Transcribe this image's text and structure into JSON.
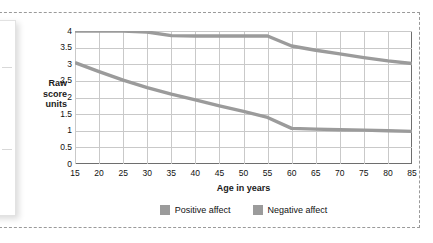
{
  "chart_data": {
    "type": "line",
    "title": "",
    "xlabel": "Age in years",
    "ylabel": "Raw score units",
    "xlim": [
      15,
      85
    ],
    "ylim": [
      0,
      4
    ],
    "grid": true,
    "legend_position": "bottom",
    "x": [
      15,
      20,
      25,
      30,
      35,
      40,
      45,
      50,
      55,
      60,
      65,
      70,
      75,
      80,
      85
    ],
    "xticklabels": [
      "15",
      "20",
      "25",
      "30",
      "35",
      "40",
      "45",
      "50",
      "55",
      "60",
      "65",
      "70",
      "75",
      "80",
      "85"
    ],
    "yticklabels": [
      "0",
      "0.5",
      "1",
      "1.5",
      "2",
      "2.5",
      "3",
      "3.5",
      "4"
    ],
    "yticks": [
      0,
      0.5,
      1,
      1.5,
      2,
      2.5,
      3,
      3.5,
      4
    ],
    "series": [
      {
        "name": "Positive affect",
        "color": "#9b9b9b",
        "values": [
          4.0,
          4.0,
          4.0,
          3.97,
          3.86,
          3.85,
          3.85,
          3.85,
          3.85,
          3.55,
          3.42,
          3.31,
          3.2,
          3.1,
          3.02
        ]
      },
      {
        "name": "Negative affect",
        "color": "#9b9b9b",
        "values": [
          3.05,
          2.78,
          2.52,
          2.3,
          2.1,
          1.93,
          1.75,
          1.58,
          1.4,
          1.07,
          1.05,
          1.03,
          1.02,
          1.0,
          0.98
        ]
      }
    ]
  },
  "axis": {
    "y_title_lines": [
      "Raw",
      "score",
      "units"
    ],
    "x_title": "Age in years"
  },
  "legend": {
    "items": [
      {
        "label": "Positive affect",
        "color": "#9b9b9b"
      },
      {
        "label": "Negative affect",
        "color": "#9b9b9b"
      }
    ]
  },
  "colors": {
    "line": "#9b9b9b",
    "grid": "#c9c9c9",
    "axis": "#6e6e6e",
    "dashed_border": "#9a9a9a",
    "text": "#111111"
  }
}
